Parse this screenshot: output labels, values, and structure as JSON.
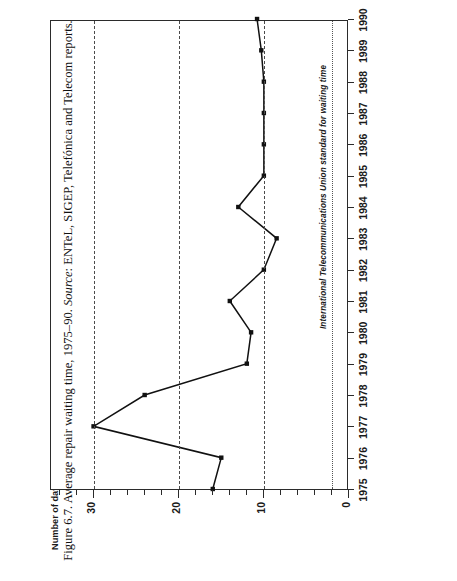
{
  "figure": {
    "caption_prefix": "Figure 6.7. Average repair waiting time, 1975–90. ",
    "caption_source_label": "Source",
    "caption_source_text": ": ENTeL, SIGEP, Telefónica and Telecom reports.",
    "axis_title_y": "Number of days",
    "annotation": "International Telecommunications Union standard for waiting time"
  },
  "chart_data": {
    "type": "line",
    "title": "Average repair waiting time, 1975–90",
    "xlabel": "",
    "ylabel": "Number of days",
    "orientation": "rotated-90-ccw",
    "x": [
      1975,
      1976,
      1977,
      1978,
      1979,
      1980,
      1981,
      1982,
      1983,
      1984,
      1985,
      1986,
      1987,
      1988,
      1989,
      1990
    ],
    "categories": [
      "1975",
      "1976",
      "1977",
      "1978",
      "1979",
      "1980",
      "1981",
      "1982",
      "1983",
      "1984",
      "1985",
      "1986",
      "1987",
      "1988",
      "1989",
      "1990"
    ],
    "values": [
      16,
      15,
      30,
      24,
      12,
      11.5,
      14,
      10,
      8.5,
      13,
      10,
      10,
      10,
      10,
      10.3,
      10.8
    ],
    "series": [
      {
        "name": "Average repair waiting time",
        "values": [
          16,
          15,
          30,
          24,
          12,
          11.5,
          14,
          10,
          8.5,
          13,
          10,
          10,
          10,
          10,
          10.3,
          10.8
        ]
      }
    ],
    "ylim": [
      0,
      35
    ],
    "xlim": [
      1975,
      1990
    ],
    "ytick_labels": [
      "30",
      "20",
      "10",
      "0"
    ],
    "ytick_values": [
      30,
      20,
      10,
      0
    ],
    "yminor_step": 2,
    "grid": "dashed gridlines at 30, 20, 10",
    "legend": "none",
    "annotations": [
      {
        "text": "International Telecommunications Union standard for waiting time",
        "value": 2,
        "style": "dotted reference line"
      }
    ],
    "marker": "filled square",
    "line_color": "#111111"
  },
  "ytick_labels": [
    "30",
    "20",
    "10",
    "0"
  ],
  "xtick_labels": [
    "1975",
    "1976",
    "1977",
    "1978",
    "1979",
    "1980",
    "1981",
    "1982",
    "1983",
    "1984",
    "1985",
    "1986",
    "1987",
    "1988",
    "1989",
    "1990"
  ]
}
